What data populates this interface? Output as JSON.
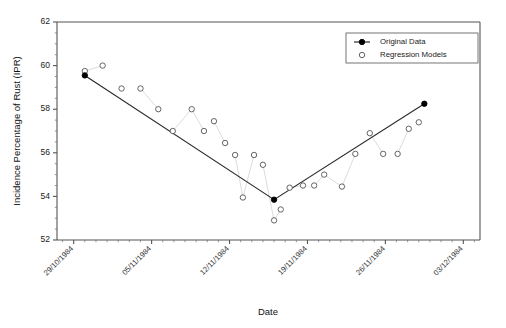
{
  "chart_data": {
    "type": "scatter",
    "title": "",
    "xlabel": "Date",
    "ylabel": "Incidence Percentage of Rust (IPR)",
    "ylim": [
      52,
      62
    ],
    "yticks": [
      52,
      54,
      56,
      58,
      60,
      62
    ],
    "ytick_labels": [
      "52",
      "54",
      "56",
      "58",
      "60",
      "62"
    ],
    "xtick_labels": [
      "29/10/1984",
      "05/11/1984",
      "12/11/1984",
      "19/11/1984",
      "26/11/1984",
      "03/12/1984"
    ],
    "xtick_days": [
      0,
      7,
      14,
      21,
      28,
      35
    ],
    "xlim_days": [
      -1.5,
      36.5
    ],
    "minor_ticks_per_interval": 7,
    "grid": false,
    "legend_position": "top-right",
    "legend_entries": [
      {
        "name": "Original Data",
        "marker": "filled-circle",
        "line": true
      },
      {
        "name": "Regression Models",
        "marker": "open-circle",
        "line": false
      }
    ],
    "series": [
      {
        "name": "Original Data",
        "marker": "filled-circle",
        "line": true,
        "x_days": [
          1.0,
          18.0,
          31.5
        ],
        "values": [
          59.55,
          53.85,
          58.25
        ]
      },
      {
        "name": "Regression Models",
        "marker": "open-circle",
        "line": false,
        "x_days": [
          1.0,
          2.6,
          4.3,
          6.0,
          7.6,
          8.9,
          10.6,
          11.7,
          12.6,
          13.6,
          14.5,
          15.2,
          16.2,
          17.0,
          18.0,
          18.6,
          19.4,
          20.6,
          21.6,
          22.5,
          24.1,
          25.3,
          26.6,
          27.8,
          29.1,
          30.1,
          31.0
        ],
        "values": [
          59.75,
          60.0,
          58.95,
          58.95,
          58.0,
          57.0,
          58.0,
          57.0,
          57.45,
          56.45,
          55.9,
          53.95,
          55.9,
          55.45,
          52.9,
          53.4,
          54.4,
          54.5,
          54.5,
          55.0,
          54.45,
          55.95,
          56.9,
          55.95,
          55.95,
          57.1,
          57.4
        ]
      }
    ],
    "connector_groups": [
      [
        [
          1.0,
          59.75
        ],
        [
          2.6,
          60.0
        ]
      ],
      [
        [
          6.0,
          58.95
        ],
        [
          7.6,
          58.0
        ]
      ],
      [
        [
          8.9,
          57.0
        ],
        [
          10.6,
          58.0
        ]
      ],
      [
        [
          10.6,
          58.0
        ],
        [
          11.7,
          57.0
        ]
      ],
      [
        [
          12.6,
          57.45
        ],
        [
          13.6,
          56.45
        ]
      ],
      [
        [
          14.5,
          55.9
        ],
        [
          15.2,
          53.95
        ]
      ],
      [
        [
          15.2,
          53.95
        ],
        [
          16.2,
          55.9
        ]
      ],
      [
        [
          17.0,
          55.45
        ],
        [
          18.0,
          52.9
        ]
      ],
      [
        [
          18.0,
          52.9
        ],
        [
          18.6,
          53.4
        ]
      ],
      [
        [
          19.4,
          54.4
        ],
        [
          20.6,
          54.5
        ]
      ],
      [
        [
          21.6,
          54.5
        ],
        [
          22.5,
          55.0
        ]
      ],
      [
        [
          22.5,
          55.0
        ],
        [
          24.1,
          54.45
        ]
      ],
      [
        [
          24.1,
          54.45
        ],
        [
          25.3,
          55.95
        ]
      ],
      [
        [
          26.6,
          56.9
        ],
        [
          27.8,
          55.95
        ]
      ],
      [
        [
          29.1,
          55.95
        ],
        [
          30.1,
          57.1
        ]
      ]
    ]
  }
}
